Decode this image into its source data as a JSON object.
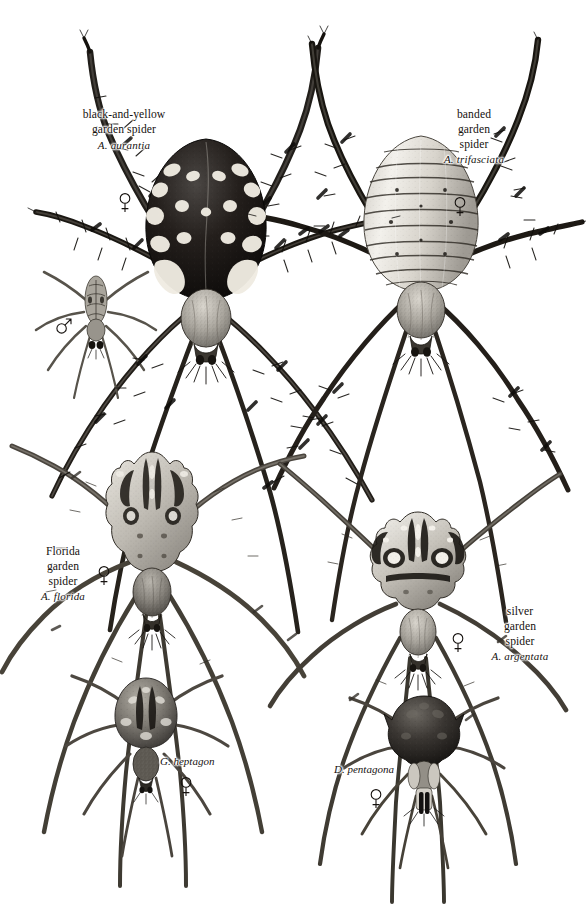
{
  "plate": {
    "title": "Garden spiders (Argiope and allies) illustration plate",
    "background_color": "#ffffff",
    "ink_color": "#16120f",
    "width": 586,
    "height": 924
  },
  "specimens": [
    {
      "id": "black-and-yellow-garden-spider",
      "common_name_lines": [
        "black-and-yellow",
        "garden spider"
      ],
      "scientific_name": "A. aurantia",
      "sex_symbol": "female",
      "sex_glyph": "♀"
    },
    {
      "id": "black-and-yellow-garden-spider-male",
      "common_name_lines": [],
      "scientific_name": "",
      "sex_symbol": "male",
      "sex_glyph": "♂"
    },
    {
      "id": "banded-garden-spider",
      "common_name_lines": [
        "banded",
        "garden",
        "spider"
      ],
      "scientific_name": "A. trifasciata",
      "sex_symbol": "female",
      "sex_glyph": "♀"
    },
    {
      "id": "florida-garden-spider",
      "common_name_lines": [
        "Florida",
        "garden",
        "spider"
      ],
      "scientific_name": "A. florida",
      "sex_symbol": "female",
      "sex_glyph": "♀"
    },
    {
      "id": "silver-garden-spider",
      "common_name_lines": [
        "silver",
        "garden",
        "spider"
      ],
      "scientific_name": "A. argentata",
      "sex_symbol": "female",
      "sex_glyph": "♀"
    },
    {
      "id": "gea-heptagon",
      "common_name_lines": [],
      "scientific_name": "G. heptagon",
      "sex_symbol": "female",
      "sex_glyph": "♀"
    },
    {
      "id": "micrathena-pentagona",
      "common_name_lines": [],
      "scientific_name": "D. pentagona",
      "sex_symbol": "female",
      "sex_glyph": "♀"
    }
  ]
}
